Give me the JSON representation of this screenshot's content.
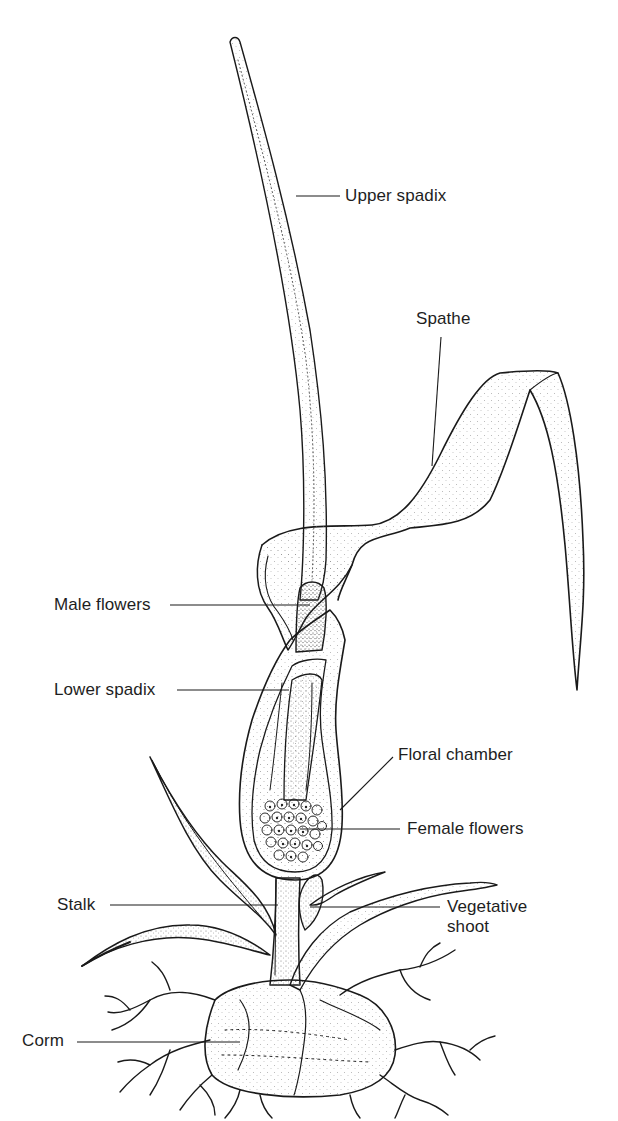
{
  "diagram": {
    "labels": [
      {
        "id": "upper-spadix",
        "text": "Upper spadix",
        "x": 345,
        "y": 187,
        "anchor_x": 296,
        "anchor_y": 193,
        "line_end_x": 340,
        "side": "right"
      },
      {
        "id": "spathe",
        "text": "Spathe",
        "x": 416,
        "y": 310,
        "anchor_x": 432,
        "anchor_y": 466,
        "line_end_x": 441,
        "line_end_y": 337,
        "side": "right"
      },
      {
        "id": "male-flowers",
        "text": "Male flowers",
        "x": 54,
        "y": 596,
        "anchor_x": 310,
        "anchor_y": 604,
        "line_end_x": 170,
        "side": "left"
      },
      {
        "id": "lower-spadix",
        "text": "Lower spadix",
        "x": 54,
        "y": 681,
        "anchor_x": 289,
        "anchor_y": 688,
        "line_end_x": 177,
        "side": "left"
      },
      {
        "id": "floral-chamber",
        "text": "Floral chamber",
        "x": 398,
        "y": 746,
        "anchor_x": 340,
        "anchor_y": 810,
        "line_end_x": 393,
        "line_end_y": 755,
        "side": "right"
      },
      {
        "id": "female-flowers",
        "text": "Female flowers",
        "x": 407,
        "y": 819,
        "anchor_x": 300,
        "anchor_y": 828,
        "line_end_x": 400,
        "side": "right"
      },
      {
        "id": "stalk",
        "text": "Stalk",
        "x": 57,
        "y": 895,
        "anchor_x": 278,
        "anchor_y": 905,
        "line_end_x": 110,
        "side": "left"
      },
      {
        "id": "vegetative-shoot",
        "text": "Vegetative\nshoot",
        "x": 447,
        "y": 893,
        "anchor_x": 330,
        "anchor_y": 907,
        "line_end_x": 440,
        "side": "right"
      },
      {
        "id": "corm",
        "text": "Corm",
        "x": 22,
        "y": 1030,
        "anchor_x": 240,
        "anchor_y": 1042,
        "line_end_x": 77,
        "side": "left"
      }
    ]
  },
  "colors": {
    "background": "#ffffff",
    "ink": "#1a1a1a",
    "stipple": "#555555",
    "label_text": "#1e1e1e"
  }
}
